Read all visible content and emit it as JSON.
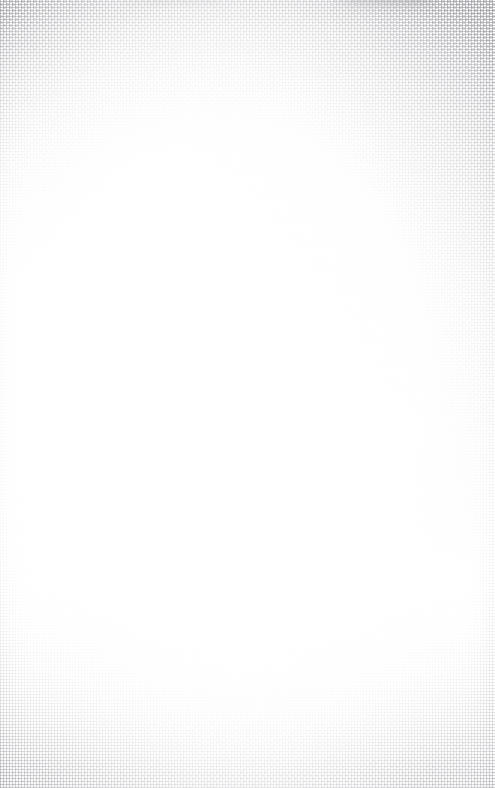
{
  "document": {
    "kind": "scanned-blank-page",
    "title": "",
    "body_text": "",
    "page_number": "",
    "caption": "",
    "has_visible_text": false,
    "width_px": 495,
    "height_px": 788
  },
  "surface": {
    "material": "woven-textile",
    "weave_type": "plain-weave",
    "thread_pitch_px": 3,
    "paper_color": "#ffffff",
    "thread_color": "#787880",
    "smudge_color": "#96969c"
  },
  "texture_regions": [
    {
      "name": "top-right-corner",
      "intensity": "strongest"
    },
    {
      "name": "top-edge-band",
      "intensity": "strong"
    },
    {
      "name": "top-left-corner",
      "intensity": "strong"
    },
    {
      "name": "bottom-edge-band",
      "intensity": "moderate"
    },
    {
      "name": "bottom-left-corner",
      "intensity": "moderate"
    },
    {
      "name": "bottom-right-corner",
      "intensity": "faint"
    },
    {
      "name": "left-selvedge",
      "intensity": "faint"
    },
    {
      "name": "right-selvedge",
      "intensity": "faint"
    },
    {
      "name": "interior",
      "intensity": "none"
    }
  ],
  "marks": [
    {
      "name": "top-smudge-primary",
      "region": "top edge, right of centre"
    },
    {
      "name": "top-smudge-secondary",
      "region": "top edge, left of centre"
    }
  ]
}
